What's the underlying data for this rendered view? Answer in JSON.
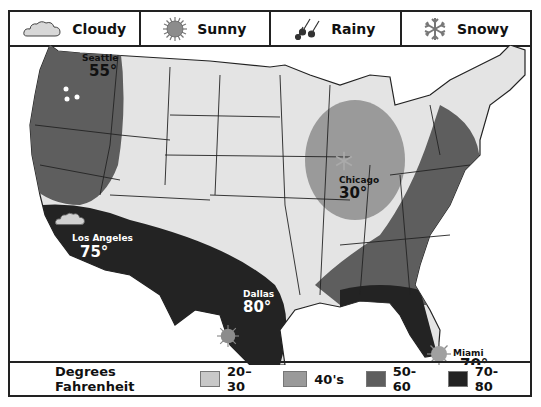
{
  "header": {
    "items": [
      {
        "label": "Cloudy",
        "icon": "cloud-icon"
      },
      {
        "label": "Sunny",
        "icon": "sun-icon"
      },
      {
        "label": "Rainy",
        "icon": "rain-icon"
      },
      {
        "label": "Snowy",
        "icon": "snowflake-icon"
      }
    ]
  },
  "cities": [
    {
      "name": "Seattle",
      "temp": "55°",
      "weather": "Rainy"
    },
    {
      "name": "Los Angeles",
      "temp": "75°",
      "weather": "Cloudy"
    },
    {
      "name": "Dallas",
      "temp": "80°",
      "weather": "Sunny"
    },
    {
      "name": "Chicago",
      "temp": "30°",
      "weather": "Snowy"
    },
    {
      "name": "Miami",
      "temp": "70°",
      "weather": "Sunny"
    }
  ],
  "legend": {
    "title": "Degrees Fahrenheit",
    "items": [
      {
        "label": "20–30",
        "color": "#c8c8c8"
      },
      {
        "label": "40's",
        "color": "#9a9a9a"
      },
      {
        "label": "50-60",
        "color": "#5e5e5e"
      },
      {
        "label": "70-80",
        "color": "#232323"
      }
    ]
  },
  "colors": {
    "land": "#e4e4e4",
    "band_20_30": "#c8c8c8",
    "band_40s": "#9a9a9a",
    "band_50_60": "#5e5e5e",
    "band_70_80": "#232323",
    "border": "#222222"
  }
}
